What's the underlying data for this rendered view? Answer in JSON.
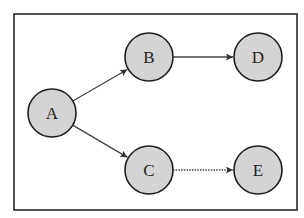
{
  "diagram": {
    "type": "directed-graph",
    "frame": {
      "x": 14,
      "y": 14,
      "width": 283,
      "height": 196,
      "stroke": "#2a2a2a"
    },
    "node_style": {
      "radius": 24,
      "fill": "#d4d4d4",
      "stroke": "#1e1e1e"
    },
    "edge_color": "#444444",
    "nodes": [
      {
        "id": "A",
        "label": "A",
        "cx": 52,
        "cy": 113
      },
      {
        "id": "B",
        "label": "B",
        "cx": 149,
        "cy": 57
      },
      {
        "id": "C",
        "label": "C",
        "cx": 149,
        "cy": 170
      },
      {
        "id": "D",
        "label": "D",
        "cx": 258,
        "cy": 57
      },
      {
        "id": "E",
        "label": "E",
        "cx": 258,
        "cy": 170
      }
    ],
    "edges": [
      {
        "from": "A",
        "to": "B",
        "style": "solid"
      },
      {
        "from": "A",
        "to": "C",
        "style": "solid"
      },
      {
        "from": "B",
        "to": "D",
        "style": "solid"
      },
      {
        "from": "C",
        "to": "E",
        "style": "dotted"
      }
    ]
  }
}
